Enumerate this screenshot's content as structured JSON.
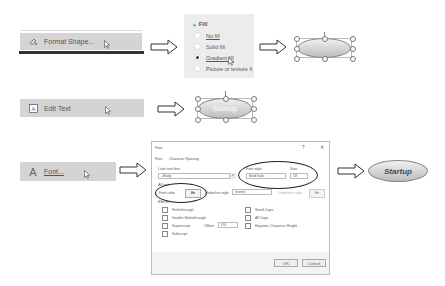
{
  "row1": {
    "menu_item": {
      "icon": "format-shape-icon",
      "label": "Format Shape..."
    },
    "fill_panel": {
      "header": "Fill",
      "chevron": "chevron-down-icon",
      "options": [
        {
          "label": "No fill",
          "selected": false
        },
        {
          "label": "Solid fill",
          "selected": false
        },
        {
          "label": "Gradient fill",
          "selected": true
        },
        {
          "label": "Picture or texture fi",
          "selected": false
        }
      ]
    },
    "result_shape": {
      "type": "ellipse",
      "fill": "gradient",
      "text": ""
    }
  },
  "row2": {
    "menu_item": {
      "icon": "edit-text-icon",
      "label": "Edit Text"
    },
    "result_shape": {
      "type": "ellipse",
      "text": "Startup"
    }
  },
  "row3": {
    "menu_item": {
      "icon": "font-A-icon",
      "label": "Font..."
    },
    "font_dialog": {
      "title": "Font",
      "help": "?",
      "close": "✕",
      "tabs": [
        "Font",
        "Character Spacing"
      ],
      "latin_text_font_label": "Latin text font:",
      "latin_text_font_value": "+Body",
      "font_style_label": "Font style:",
      "font_style_value": "Bold Italic",
      "size_label": "Size:",
      "size_value": "18",
      "all_text_label": "All text",
      "font_color_label": "Font color",
      "underline_style_label": "Underline style",
      "underline_style_value": "(none)",
      "underline_color_label": "Underline color",
      "effects_label": "Effects",
      "effects_left": [
        "Strikethrough",
        "Double Strikethrough",
        "Superscript",
        "Subscript"
      ],
      "effects_right": [
        "Small Caps",
        "All Caps",
        "Equalize Character Height"
      ],
      "offset_label": "Offset:",
      "offset_value": "0%",
      "ok_label": "OK",
      "cancel_label": "Cancel"
    },
    "result_shape": {
      "type": "ellipse",
      "text": "Startup",
      "style": "bold italic"
    }
  },
  "colors": {
    "menu_bg": "#d4d4d4",
    "panel_bg": "#ececec",
    "shape_border": "#888888",
    "shape_text": "#3a4a5a"
  }
}
